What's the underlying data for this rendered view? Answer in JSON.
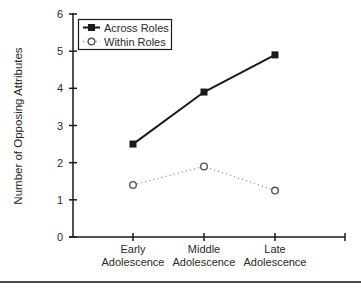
{
  "figure": {
    "background_color": "#ffffff",
    "axis_color": "#1a1a1a",
    "text_color": "#2a2a2a",
    "bottom_rule_color": "#4d4d4d"
  },
  "chart_data": {
    "type": "line",
    "title": "",
    "categories": [
      "Early Adolescence",
      "Middle Adolescence",
      "Late Adolescence"
    ],
    "series": [
      {
        "name": "Across Roles",
        "values": [
          2.5,
          3.9,
          4.9
        ],
        "marker": "filled-square",
        "line_style": "solid",
        "line_color": "#1a1a1a",
        "marker_color": "#1a1a1a"
      },
      {
        "name": "Within Roles",
        "values": [
          1.4,
          1.9,
          1.25
        ],
        "marker": "open-circle",
        "line_style": "dotted",
        "line_color": "#999999",
        "marker_color": "#555555"
      }
    ],
    "xlabel": "",
    "ylabel": "Number of Opposing Attributes",
    "ylim": [
      0,
      6
    ],
    "yticks": [
      0,
      1,
      2,
      3,
      4,
      5,
      6
    ],
    "grid": false,
    "legend_position": "top-left",
    "x_axis_end_tick": true
  }
}
